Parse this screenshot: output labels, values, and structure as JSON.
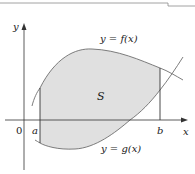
{
  "diagram": {
    "labels": {
      "y_axis": "y",
      "x_axis": "x",
      "origin": "0",
      "a": "a",
      "b": "b",
      "region": "S",
      "upper_curve": "y = f(x)",
      "lower_curve": "y = g(x)"
    },
    "colors": {
      "region_fill": "#e0e0e0",
      "curve_stroke": "#6e6e6e",
      "axis_stroke": "#333333",
      "text": "#1a1a1a"
    }
  }
}
